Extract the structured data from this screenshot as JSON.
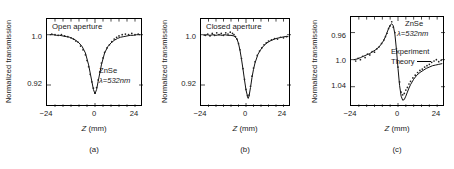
{
  "figure": {
    "background": "#ffffff",
    "ink": "#1a1a1a"
  },
  "panels": [
    {
      "key": "a",
      "panel_label": "(a)",
      "inner_title": "Open aperture",
      "ylabel": "Normalized transmission",
      "xlabel_var": "Z",
      "xlabel_unit": "(mm)",
      "yticks": [
        "1.0",
        "0.92"
      ],
      "xticks": [
        "−24",
        "0",
        "24"
      ],
      "annotations": [
        "ZnSe",
        "λ=532nm"
      ]
    },
    {
      "key": "b",
      "panel_label": "(b)",
      "inner_title": "Closed aperture",
      "ylabel": "Normalized transmission",
      "xlabel_var": "Z",
      "xlabel_unit": "(mm)",
      "yticks": [
        "1.0",
        "0.92"
      ],
      "xticks": [
        "−24",
        "0",
        "24"
      ],
      "annotations": []
    },
    {
      "key": "c",
      "panel_label": "(c)",
      "inner_title": "",
      "ylabel": "Normalized transmission",
      "xlabel_var": "Z",
      "xlabel_unit": "(mm)",
      "yticks": [
        "1.04",
        "1.0",
        "0.96"
      ],
      "xticks": [
        "−24",
        "0",
        "24"
      ],
      "annotations": [
        "ZnSe",
        "λ=532nm"
      ],
      "legend": {
        "experiment": "Experiment",
        "theory": "Theory"
      }
    }
  ],
  "chart_data": [
    {
      "type": "scatter",
      "panel": "(a)",
      "title": "Open aperture",
      "xlabel": "Z (mm)",
      "ylabel": "Normalized transmission",
      "xlim": [
        -30,
        30
      ],
      "ylim": [
        0.885,
        1.025
      ],
      "xticks": [
        -24,
        0,
        24
      ],
      "yticks": [
        0.92,
        1.0
      ],
      "grid": false,
      "sample": "ZnSe",
      "wavelength": "λ=532nm",
      "series": [
        {
          "name": "Theory",
          "kind": "line",
          "x": [
            -28,
            -26,
            -24,
            -22,
            -20,
            -18,
            -16,
            -14,
            -12,
            -10,
            -8,
            -6,
            -4,
            -3,
            -2,
            -1,
            0,
            1,
            2,
            3,
            4,
            6,
            8,
            10,
            12,
            14,
            16,
            18,
            20,
            22,
            24,
            26,
            28
          ],
          "y": [
            1.0,
            1.0,
            0.999,
            0.999,
            0.998,
            0.997,
            0.996,
            0.994,
            0.991,
            0.987,
            0.981,
            0.971,
            0.952,
            0.939,
            0.926,
            0.913,
            0.906,
            0.913,
            0.926,
            0.939,
            0.952,
            0.971,
            0.981,
            0.987,
            0.991,
            0.994,
            0.996,
            0.997,
            0.998,
            0.999,
            0.999,
            1.0,
            1.0
          ]
        },
        {
          "name": "Experiment",
          "kind": "points",
          "x": [
            -27,
            -25,
            -23,
            -21,
            -19,
            -17,
            -15,
            -13.5,
            -12,
            -10.5,
            -9,
            -7.5,
            -6,
            -5,
            -4,
            -3,
            -2,
            -1,
            0,
            1,
            2,
            3,
            4,
            5,
            6,
            7.5,
            9,
            10.5,
            12,
            13.5,
            15,
            17,
            19,
            21,
            23,
            25,
            27
          ],
          "y": [
            1.001,
            1.0,
            0.999,
            1.0,
            0.998,
            0.997,
            0.995,
            0.993,
            0.99,
            0.988,
            0.982,
            0.976,
            0.968,
            0.959,
            0.949,
            0.937,
            0.925,
            0.915,
            0.907,
            0.916,
            0.928,
            0.941,
            0.955,
            0.963,
            0.972,
            0.979,
            0.984,
            0.989,
            0.993,
            0.996,
            0.998,
            1.0,
            1.001,
            1.0,
            1.002,
            1.0,
            1.001
          ]
        }
      ]
    },
    {
      "type": "scatter",
      "panel": "(b)",
      "title": "Closed aperture",
      "xlabel": "Z (mm)",
      "ylabel": "Normalized transmission",
      "xlim": [
        -30,
        30
      ],
      "ylim": [
        0.885,
        1.025
      ],
      "xticks": [
        -24,
        0,
        24
      ],
      "yticks": [
        0.92,
        1.0
      ],
      "grid": false,
      "series": [
        {
          "name": "Theory",
          "kind": "line",
          "x": [
            -28,
            -26,
            -24,
            -22,
            -20,
            -18,
            -16,
            -14,
            -12,
            -10,
            -8,
            -7,
            -6,
            -5,
            -4,
            -3,
            -2,
            -1,
            0,
            1,
            1.5,
            2,
            3,
            4,
            5,
            6,
            8,
            10,
            12,
            14,
            16,
            18,
            20,
            22,
            24,
            26,
            28
          ],
          "y": [
            0.999,
            1.0,
            0.999,
            1.0,
            0.999,
            1.0,
            0.999,
            1.0,
            0.999,
            0.999,
            0.998,
            0.996,
            0.993,
            0.986,
            0.975,
            0.961,
            0.945,
            0.928,
            0.912,
            0.902,
            0.899,
            0.902,
            0.916,
            0.932,
            0.945,
            0.955,
            0.969,
            0.977,
            0.983,
            0.987,
            0.99,
            0.992,
            0.994,
            0.995,
            0.996,
            0.997,
            0.997
          ]
        },
        {
          "name": "Experiment",
          "kind": "points",
          "x": [
            -27,
            -25.5,
            -24,
            -22.5,
            -21,
            -19.5,
            -18,
            -16.5,
            -15,
            -13.5,
            -12,
            -10.5,
            -9,
            -8,
            -7,
            -6,
            -5,
            -4,
            -3,
            -2,
            -1,
            0,
            1,
            1.5,
            2,
            3,
            4,
            5,
            6,
            7.5,
            9,
            10.5,
            12,
            13.5,
            15,
            17,
            19,
            21,
            23,
            25,
            27
          ],
          "y": [
            0.999,
            1.001,
            0.998,
            1.002,
            0.999,
            1.003,
            1.0,
            1.002,
            0.999,
            1.003,
            1.001,
            1.004,
            1.002,
            1.0,
            0.997,
            0.993,
            0.986,
            0.976,
            0.962,
            0.946,
            0.929,
            0.913,
            0.903,
            0.9,
            0.904,
            0.918,
            0.934,
            0.947,
            0.957,
            0.967,
            0.974,
            0.979,
            0.984,
            0.987,
            0.99,
            0.992,
            0.994,
            0.993,
            0.996,
            0.995,
            0.997
          ]
        }
      ]
    },
    {
      "type": "scatter",
      "panel": "(c)",
      "title": "",
      "xlabel": "Z (mm)",
      "ylabel": "Normalized transmission",
      "xlim": [
        -30,
        30
      ],
      "ylim": [
        0.93,
        1.063
      ],
      "xticks": [
        -24,
        0,
        24
      ],
      "yticks": [
        0.96,
        1.0,
        1.04
      ],
      "grid": false,
      "sample": "ZnSe",
      "wavelength": "λ=532nm",
      "series": [
        {
          "name": "Theory",
          "kind": "line",
          "x": [
            -28,
            -26,
            -24,
            -22,
            -20,
            -18,
            -16,
            -14,
            -12,
            -10,
            -9,
            -8,
            -7,
            -6,
            -5,
            -4,
            -3,
            -2,
            -1,
            0,
            1,
            2,
            3,
            4,
            5,
            6,
            7,
            8,
            9,
            10,
            12,
            14,
            16,
            18,
            20,
            22,
            24,
            26,
            28
          ],
          "y": [
            1.0,
            1.001,
            1.003,
            1.005,
            1.007,
            1.009,
            1.012,
            1.015,
            1.019,
            1.025,
            1.029,
            1.034,
            1.04,
            1.046,
            1.051,
            1.053,
            1.05,
            1.038,
            1.015,
            0.987,
            0.962,
            0.946,
            0.94,
            0.941,
            0.946,
            0.952,
            0.958,
            0.963,
            0.967,
            0.971,
            0.977,
            0.981,
            0.984,
            0.987,
            0.989,
            0.991,
            0.992,
            0.993,
            0.994
          ]
        },
        {
          "name": "Experiment",
          "kind": "points",
          "x": [
            -27,
            -25.5,
            -24,
            -22.5,
            -21,
            -19.5,
            -18,
            -16.5,
            -15,
            -13.5,
            -12,
            -10.5,
            -9,
            -8,
            -7,
            -6,
            -5,
            -4,
            -3,
            -2,
            -1,
            0,
            1,
            2,
            3,
            4,
            5,
            6,
            7,
            8,
            9.5,
            11,
            12.5,
            14,
            15.5,
            17,
            18.5,
            20,
            21.5,
            23,
            24.5,
            26,
            27.5
          ],
          "y": [
            0.998,
            1.002,
            1.0,
            1.005,
            1.003,
            1.008,
            1.007,
            1.012,
            1.011,
            1.016,
            1.019,
            1.024,
            1.029,
            1.034,
            1.039,
            1.046,
            1.05,
            1.056,
            1.048,
            1.04,
            1.016,
            0.989,
            0.967,
            0.952,
            0.948,
            0.95,
            0.955,
            0.959,
            0.964,
            0.968,
            0.973,
            0.977,
            0.981,
            0.984,
            0.986,
            0.989,
            0.991,
            0.993,
            0.996,
            0.998,
            1.0,
            0.997,
            0.999
          ]
        }
      ]
    }
  ]
}
